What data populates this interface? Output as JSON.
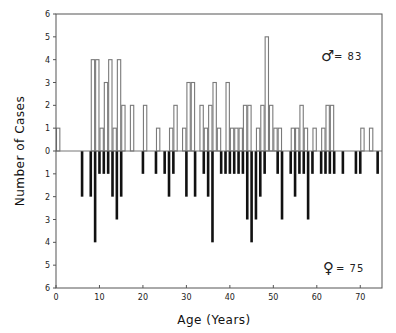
{
  "chart_data": {
    "type": "bar",
    "title": "",
    "xlabel": "Age (Years)",
    "ylabel": "Number of Cases",
    "xlim": [
      0,
      75
    ],
    "ylim": [
      -6,
      6
    ],
    "x_ticks": [
      0,
      10,
      20,
      30,
      40,
      50,
      60,
      70
    ],
    "y_ticks": [
      6,
      5,
      4,
      3,
      2,
      1,
      0,
      1,
      2,
      3,
      4,
      5,
      6
    ],
    "grid": false,
    "series": [
      {
        "name": "Male",
        "direction": "up",
        "style": "open",
        "color": "#7a7a7a",
        "annotation_symbol": "♂",
        "annotation_text": "= 83",
        "total": 83,
        "points": [
          {
            "age": 0,
            "count": 1
          },
          {
            "age": 8,
            "count": 4
          },
          {
            "age": 9,
            "count": 4
          },
          {
            "age": 10,
            "count": 1
          },
          {
            "age": 11,
            "count": 3
          },
          {
            "age": 12,
            "count": 4
          },
          {
            "age": 13,
            "count": 1
          },
          {
            "age": 14,
            "count": 4
          },
          {
            "age": 15,
            "count": 2
          },
          {
            "age": 17,
            "count": 2
          },
          {
            "age": 20,
            "count": 2
          },
          {
            "age": 23,
            "count": 1
          },
          {
            "age": 26,
            "count": 1
          },
          {
            "age": 27,
            "count": 2
          },
          {
            "age": 29,
            "count": 1
          },
          {
            "age": 30,
            "count": 3
          },
          {
            "age": 31,
            "count": 3
          },
          {
            "age": 33,
            "count": 2
          },
          {
            "age": 34,
            "count": 1
          },
          {
            "age": 35,
            "count": 2
          },
          {
            "age": 36,
            "count": 3
          },
          {
            "age": 37,
            "count": 1
          },
          {
            "age": 39,
            "count": 3
          },
          {
            "age": 40,
            "count": 1
          },
          {
            "age": 41,
            "count": 1
          },
          {
            "age": 42,
            "count": 1
          },
          {
            "age": 43,
            "count": 2
          },
          {
            "age": 44,
            "count": 2
          },
          {
            "age": 46,
            "count": 1
          },
          {
            "age": 47,
            "count": 2
          },
          {
            "age": 48,
            "count": 5
          },
          {
            "age": 49,
            "count": 2
          },
          {
            "age": 50,
            "count": 1
          },
          {
            "age": 51,
            "count": 1
          },
          {
            "age": 54,
            "count": 1
          },
          {
            "age": 55,
            "count": 1
          },
          {
            "age": 56,
            "count": 2
          },
          {
            "age": 57,
            "count": 1
          },
          {
            "age": 59,
            "count": 1
          },
          {
            "age": 61,
            "count": 1
          },
          {
            "age": 62,
            "count": 2
          },
          {
            "age": 63,
            "count": 2
          },
          {
            "age": 70,
            "count": 1
          },
          {
            "age": 72,
            "count": 1
          }
        ]
      },
      {
        "name": "Female",
        "direction": "down",
        "style": "solid",
        "color": "#111111",
        "annotation_symbol": "♀",
        "annotation_text": "= 75",
        "total": 75,
        "points": [
          {
            "age": 6,
            "count": 2
          },
          {
            "age": 8,
            "count": 2
          },
          {
            "age": 9,
            "count": 4
          },
          {
            "age": 10,
            "count": 1
          },
          {
            "age": 11,
            "count": 1
          },
          {
            "age": 12,
            "count": 1
          },
          {
            "age": 13,
            "count": 2
          },
          {
            "age": 14,
            "count": 3
          },
          {
            "age": 15,
            "count": 2
          },
          {
            "age": 20,
            "count": 1
          },
          {
            "age": 23,
            "count": 1
          },
          {
            "age": 25,
            "count": 1
          },
          {
            "age": 26,
            "count": 2
          },
          {
            "age": 27,
            "count": 1
          },
          {
            "age": 30,
            "count": 2
          },
          {
            "age": 32,
            "count": 2
          },
          {
            "age": 34,
            "count": 1
          },
          {
            "age": 35,
            "count": 2
          },
          {
            "age": 36,
            "count": 4
          },
          {
            "age": 38,
            "count": 1
          },
          {
            "age": 39,
            "count": 1
          },
          {
            "age": 40,
            "count": 1
          },
          {
            "age": 41,
            "count": 1
          },
          {
            "age": 42,
            "count": 1
          },
          {
            "age": 43,
            "count": 1
          },
          {
            "age": 44,
            "count": 3
          },
          {
            "age": 45,
            "count": 4
          },
          {
            "age": 46,
            "count": 3
          },
          {
            "age": 47,
            "count": 2
          },
          {
            "age": 48,
            "count": 1
          },
          {
            "age": 51,
            "count": 1
          },
          {
            "age": 52,
            "count": 3
          },
          {
            "age": 54,
            "count": 1
          },
          {
            "age": 55,
            "count": 2
          },
          {
            "age": 56,
            "count": 1
          },
          {
            "age": 57,
            "count": 1
          },
          {
            "age": 58,
            "count": 3
          },
          {
            "age": 59,
            "count": 1
          },
          {
            "age": 61,
            "count": 1
          },
          {
            "age": 62,
            "count": 1
          },
          {
            "age": 63,
            "count": 1
          },
          {
            "age": 64,
            "count": 1
          },
          {
            "age": 66,
            "count": 1
          },
          {
            "age": 69,
            "count": 1
          },
          {
            "age": 70,
            "count": 1
          },
          {
            "age": 74,
            "count": 1
          }
        ]
      }
    ],
    "legend": "annotations at top-right (male) and bottom-right (female)"
  }
}
